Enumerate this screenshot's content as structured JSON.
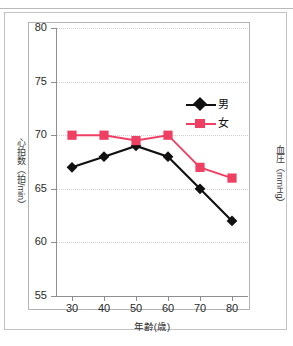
{
  "page": {
    "top_ghost_text": "",
    "accent_male": "#111111",
    "accent_female": "#ef3f63"
  },
  "chart_data": {
    "type": "line",
    "title": "",
    "xlabel": "年齢(歳)",
    "ylabel": "心拍数（拍/min）",
    "ylabel_right": "血圧（mmHg）",
    "categories": [
      30,
      40,
      50,
      60,
      70,
      80
    ],
    "x": [
      30,
      40,
      50,
      60,
      70,
      80
    ],
    "xlim": [
      25,
      85
    ],
    "ylim": [
      55,
      80
    ],
    "xticks": [
      30,
      40,
      50,
      60,
      70,
      80
    ],
    "yticks": [
      55,
      60,
      65,
      70,
      75,
      80
    ],
    "grid": true,
    "legend_position": "upper-right-inside",
    "series": [
      {
        "name": "男",
        "color": "#111111",
        "marker": "diamond",
        "values": [
          67,
          68,
          69,
          68,
          65,
          62
        ]
      },
      {
        "name": "女",
        "color": "#ef3f63",
        "marker": "square",
        "values": [
          70,
          70,
          69.5,
          70,
          67,
          66
        ]
      }
    ]
  }
}
